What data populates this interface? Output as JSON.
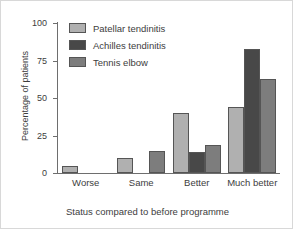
{
  "chart_data": {
    "type": "bar",
    "title": "",
    "xlabel": "Status compared to before programme",
    "ylabel": "Percentage of patients",
    "categories": [
      "Worse",
      "Same",
      "Better",
      "Much better"
    ],
    "series": [
      {
        "name": "Patellar tendinitis",
        "color": "#b0b0b0",
        "values": [
          5,
          10,
          40,
          44
        ]
      },
      {
        "name": "Achilles tendinitis",
        "color": "#484848",
        "values": [
          0,
          0,
          14,
          83
        ]
      },
      {
        "name": "Tennis elbow",
        "color": "#7d7d7d",
        "values": [
          0,
          15,
          19,
          63
        ]
      }
    ],
    "ylim": [
      0,
      100
    ],
    "yticks": [
      0,
      25,
      50,
      75,
      100
    ],
    "ytick_labels": [
      "0",
      "25",
      "50",
      "75",
      "100"
    ],
    "grid": false,
    "legend_position": "top-left-inside",
    "axis_color": "#6e6e6e",
    "text_color": "#3d3d3d",
    "background": "#ffffff",
    "frame_color": "#d8d8d8"
  }
}
